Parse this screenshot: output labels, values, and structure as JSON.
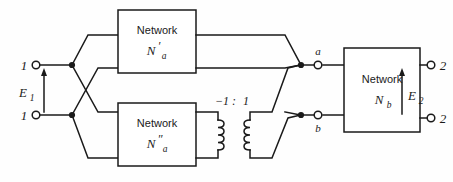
{
  "diagram": {
    "type": "schematic",
    "stroke_color": "#1a1a1a",
    "background_color": "#fefefe"
  },
  "boxes": {
    "network_a_prime": {
      "word": "Network",
      "symbol": "N′a",
      "sym_base": "N",
      "sym_prime": "′",
      "sym_sub": "a"
    },
    "network_a_double_prime": {
      "word": "Network",
      "symbol": "N″a",
      "sym_base": "N",
      "sym_prime": "″",
      "sym_sub": "a"
    },
    "network_b": {
      "word": "Network",
      "symbol": "Nb",
      "sym_base": "N",
      "sym_prime": "",
      "sym_sub": "b"
    }
  },
  "terminals": {
    "input_top": "1",
    "input_bottom": "1",
    "output_top": "2",
    "output_bottom": "2",
    "mid_top": "a",
    "mid_bottom": "b"
  },
  "voltages": {
    "input": "E1",
    "input_base": "E",
    "input_sub": "1",
    "output": "E2",
    "output_base": "E",
    "output_sub": "2"
  },
  "transformer": {
    "ratio": "-1 : 1",
    "ratio_left": "−1",
    "ratio_colon": ":",
    "ratio_right": "1",
    "turns": 4
  }
}
